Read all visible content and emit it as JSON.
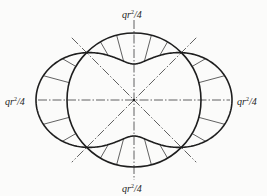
{
  "diagram": {
    "type": "bending-moment-diagram-ring",
    "center": [
      134,
      100
    ],
    "ring_radius": 67,
    "moment_amplitude_px": 31,
    "hatch_angles_deg": [
      15,
      30,
      60,
      75,
      105,
      120,
      150,
      165,
      195,
      210,
      240,
      255,
      285,
      300,
      330,
      345
    ],
    "diagonal_angles_deg": [
      45,
      135
    ],
    "diagonal_half_length": 88,
    "axis_extent": {
      "h": [
        38,
        230
      ],
      "v": [
        20,
        180
      ]
    },
    "colors": {
      "stroke": "#1e1e1e",
      "thin": "#3a3a3a",
      "background": "#fbfbfa"
    }
  },
  "labels": {
    "top": {
      "base": "qr",
      "exp": "2",
      "tail": "/4"
    },
    "bottom": {
      "base": "qr",
      "exp": "2",
      "tail": "/4"
    },
    "left": {
      "base": "qr",
      "exp": "2",
      "tail": "/4"
    },
    "right": {
      "base": "qr",
      "exp": "2",
      "tail": "/4"
    }
  }
}
